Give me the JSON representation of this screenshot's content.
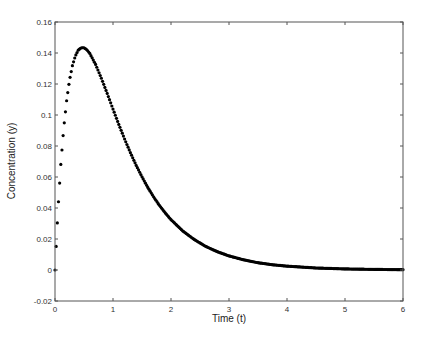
{
  "chart_data": {
    "type": "scatter",
    "title": "",
    "xlabel": "Time (t)",
    "ylabel": "Concentration (y)",
    "xlim": [
      0,
      6
    ],
    "ylim": [
      -0.02,
      0.16
    ],
    "xticks": [
      0,
      1,
      2,
      3,
      4,
      5,
      6
    ],
    "xtick_labels": [
      "0",
      "1",
      "2",
      "3",
      "4",
      "5",
      "6"
    ],
    "yticks": [
      -0.02,
      0,
      0.02,
      0.04,
      0.06,
      0.08,
      0.1,
      0.12,
      0.14,
      0.16
    ],
    "ytick_labels": [
      "-0.02",
      "0",
      "0.02",
      "0.04",
      "0.06",
      "0.08",
      "0.1",
      "0.12",
      "0.14",
      "0.16"
    ],
    "grid": false,
    "legend": null,
    "marker": "*",
    "marker_spacing_t": 0.02,
    "color": "#000000",
    "series": [
      {
        "name": "Concentration",
        "x": [
          0,
          0.05,
          0.1,
          0.15,
          0.2,
          0.25,
          0.3,
          0.35,
          0.4,
          0.45,
          0.5,
          0.55,
          0.6,
          0.7,
          0.8,
          0.9,
          1.0,
          1.1,
          1.2,
          1.3,
          1.4,
          1.5,
          1.6,
          1.7,
          1.8,
          1.9,
          2.0,
          2.2,
          2.4,
          2.6,
          2.8,
          3.0,
          3.25,
          3.5,
          3.75,
          4.0,
          4.5,
          5.0,
          5.5,
          6.0
        ],
        "y": [
          0,
          0.038,
          0.0681,
          0.0914,
          0.1092,
          0.1224,
          0.1318,
          0.138,
          0.1418,
          0.1434,
          0.1434,
          0.1421,
          0.1397,
          0.1326,
          0.1237,
          0.1139,
          0.1038,
          0.0939,
          0.0845,
          0.0757,
          0.0675,
          0.0601,
          0.0533,
          0.0472,
          0.0417,
          0.0369,
          0.0325,
          0.0253,
          0.0197,
          0.0152,
          0.0118,
          0.0091,
          0.0066,
          0.0047,
          0.0034,
          0.0025,
          0.0013,
          0.0007,
          0.0004,
          0.0002
        ]
      }
    ]
  }
}
